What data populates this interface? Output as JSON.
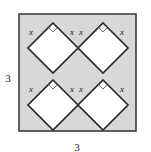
{
  "figure": {
    "type": "geometry-diagram",
    "width": 151,
    "height": 152,
    "background_color": "#ffffff"
  },
  "outer_square": {
    "name": "outer-square",
    "fill_color": "#d8d8d8",
    "stroke_color": "#3d3d3d",
    "left": 19,
    "top": 14,
    "size": 117
  },
  "dimensions": [
    {
      "id": "left-dimension",
      "label": "3",
      "position": "left",
      "x": 8,
      "y": 78
    },
    {
      "id": "bottom-dimension",
      "label": "3",
      "position": "bottom",
      "x": 77,
      "y": 150
    }
  ],
  "diamonds": [
    {
      "id": "diamond-top-left",
      "center_x": 53,
      "center_y": 48,
      "radius": 25,
      "fill_color": "#ffffff",
      "stroke_color": "#2b2b2b",
      "labels": [
        {
          "id": "label-left",
          "text": "x",
          "x": 31,
          "y": 34
        },
        {
          "id": "label-right",
          "text": "x",
          "x": 71,
          "y": 34
        }
      ],
      "right_angle_marker": {
        "size": 7
      }
    },
    {
      "id": "diamond-top-right",
      "center_x": 103,
      "center_y": 48,
      "radius": 25,
      "fill_color": "#ffffff",
      "stroke_color": "#2b2b2b",
      "labels": [
        {
          "id": "label-left",
          "text": "x",
          "x": 81,
          "y": 34
        },
        {
          "id": "label-right",
          "text": "x",
          "x": 121,
          "y": 34
        }
      ],
      "right_angle_marker": {
        "size": 7
      }
    },
    {
      "id": "diamond-bottom-left",
      "center_x": 53,
      "center_y": 105,
      "radius": 25,
      "fill_color": "#ffffff",
      "stroke_color": "#2b2b2b",
      "labels": [
        {
          "id": "label-left",
          "text": "x",
          "x": 31,
          "y": 91
        },
        {
          "id": "label-right",
          "text": "x",
          "x": 71,
          "y": 91
        }
      ],
      "right_angle_marker": {
        "size": 7
      }
    },
    {
      "id": "diamond-bottom-right",
      "center_x": 103,
      "center_y": 105,
      "radius": 25,
      "fill_color": "#ffffff",
      "stroke_color": "#2b2b2b",
      "labels": [
        {
          "id": "label-left",
          "text": "x",
          "x": 81,
          "y": 91
        },
        {
          "id": "label-right",
          "text": "x",
          "x": 121,
          "y": 91
        }
      ],
      "right_angle_marker": {
        "size": 7
      }
    }
  ]
}
